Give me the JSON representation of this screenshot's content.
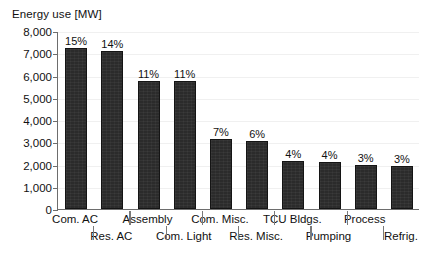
{
  "chart_data": {
    "type": "bar",
    "title": "Energy use [MW]",
    "xlabel": "",
    "ylabel": "Energy use [MW]",
    "ylim": [
      0,
      8000
    ],
    "grid": true,
    "legend": "none",
    "categories": [
      "Com. AC",
      "Res. AC",
      "Assembly",
      "Com. Light",
      "Com. Misc.",
      "Res. Misc.",
      "TCU Bldgs.",
      "Pumping",
      "Process",
      "Refrig."
    ],
    "values": [
      7250,
      7100,
      5750,
      5750,
      3150,
      3070,
      2150,
      2120,
      2000,
      1920
    ],
    "data_labels": [
      "15%",
      "14%",
      "11%",
      "11%",
      "7%",
      "6%",
      "4%",
      "4%",
      "3%",
      "3%"
    ],
    "ytick_labels": [
      "8,000",
      "7,000",
      "6,000",
      "5,000",
      "4,000",
      "3,000",
      "2,000",
      "1,000",
      "0"
    ],
    "ytick_values": [
      8000,
      7000,
      6000,
      5000,
      4000,
      3000,
      2000,
      1000,
      0
    ],
    "bar_color": "#2b2b2b",
    "axis_color": "#6d6d6d",
    "grid_color": "#f0f0f0",
    "label_rows": [
      "top",
      "bottom",
      "top",
      "bottom",
      "top",
      "bottom",
      "top",
      "bottom",
      "top",
      "bottom"
    ]
  }
}
